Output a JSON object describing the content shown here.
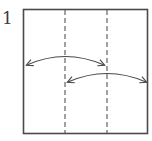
{
  "step": {
    "number": "1"
  },
  "diagram": {
    "paper": {
      "x": 23,
      "y": 9,
      "width": 125,
      "height": 125,
      "stroke": "#4a4a4a"
    },
    "valley_folds": [
      {
        "x": 65,
        "y1": 9,
        "y2": 134
      },
      {
        "x": 107,
        "y1": 9,
        "y2": 134
      }
    ],
    "fold_unfold_arrows": [
      {
        "from": [
          27,
          65
        ],
        "to": [
          104,
          65
        ],
        "peak_y": 56
      },
      {
        "from": [
          68,
          82
        ],
        "to": [
          146,
          82
        ],
        "peak_y": 73
      }
    ],
    "line_color": "#4a4a4a"
  }
}
